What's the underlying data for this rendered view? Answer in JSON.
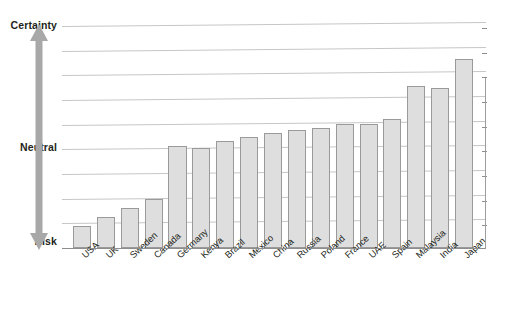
{
  "chart_data": {
    "type": "bar",
    "title": "",
    "subtitle": "",
    "xlabel": "",
    "ylabel": "",
    "categories": [
      "USA",
      "UK",
      "Sweden",
      "Canada",
      "Germany",
      "Kenya",
      "Brazil",
      "Mexico",
      "China",
      "Russia",
      "Poland",
      "France",
      "UAE",
      "Spain",
      "Malaysia",
      "India",
      "Japan"
    ],
    "values": [
      1.0,
      1.4,
      1.8,
      2.2,
      4.6,
      4.5,
      4.8,
      5.0,
      5.2,
      5.3,
      5.4,
      5.6,
      5.6,
      5.8,
      7.3,
      7.2,
      8.5
    ],
    "y_axis": {
      "tick_labels": [
        "Certainty",
        "Neutral",
        "Risk"
      ],
      "tick_positions": [
        10,
        5,
        0
      ],
      "ylim": [
        0,
        10
      ],
      "direction": "Risk at bottom, Certainty at top",
      "arrow": "double-headed vertical arrow",
      "arrow_color": "#a6a6a6"
    },
    "gridlines": {
      "visible": true,
      "count": 9,
      "orientation": "horizontal",
      "color": "#c6c6c6"
    },
    "legend": {
      "visible": false,
      "position": "none"
    },
    "bar_style": {
      "fill": "#dedede",
      "border": "#9a9a9a",
      "orientation": "vertical"
    },
    "axis_color": "#8d8d8d",
    "background": "#ffffff",
    "label_rotation_deg": -43,
    "note": "Bar heights ascend from USA (lowest, nearest Risk) to Japan (highest, nearest Certainty)"
  },
  "axis": {
    "top_label": "Certainty",
    "middle_label": "Neutral",
    "bottom_label": "Risk"
  }
}
